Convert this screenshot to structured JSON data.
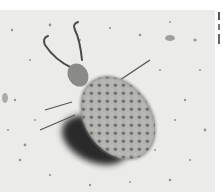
{
  "image": {
    "subject": "antlion larva on sand",
    "style": "grayscale photograph",
    "colors": {
      "sand": "#e9e9e7",
      "body": "#a8a8a4",
      "body_dark": "#4a4a48",
      "shadow": "#2a2a2a",
      "speck": "#6a6a68"
    }
  }
}
